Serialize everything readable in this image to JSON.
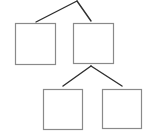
{
  "diagram": {
    "type": "tree",
    "colors": {
      "edge": "#2f2f2f",
      "node_border": "#8a8a8a",
      "background": "#ffffff"
    },
    "nodes": [
      {
        "id": "n1",
        "label": "",
        "x": 15,
        "y": 23,
        "w": 40,
        "h": 41
      },
      {
        "id": "n2",
        "label": "",
        "x": 73,
        "y": 23,
        "w": 40,
        "h": 40
      },
      {
        "id": "n3",
        "label": "",
        "x": 43,
        "y": 89,
        "w": 39,
        "h": 40
      },
      {
        "id": "n4",
        "label": "",
        "x": 102,
        "y": 89,
        "w": 39,
        "h": 39
      }
    ],
    "edges": [
      {
        "id": "e1",
        "from": [
          77,
          1
        ],
        "to": [
          36,
          22
        ]
      },
      {
        "id": "e2",
        "from": [
          77,
          1
        ],
        "to": [
          91,
          21
        ]
      },
      {
        "id": "e3",
        "from": [
          91,
          66
        ],
        "to": [
          63,
          86
        ]
      },
      {
        "id": "e4",
        "from": [
          91,
          66
        ],
        "to": [
          122,
          86
        ]
      }
    ]
  }
}
